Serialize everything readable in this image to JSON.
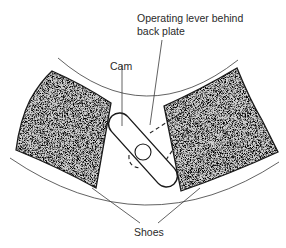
{
  "diagram": {
    "type": "brake-cam-mechanism",
    "labels": {
      "cam": "Cam",
      "lever_line1": "Operating lever behind",
      "lever_line2": "back plate",
      "shoes": "Shoes"
    },
    "colors": {
      "background": "#ffffff",
      "line": "#1a1a1a",
      "shoe_fill_dark": "#3a3a3a",
      "shoe_fill_light": "#cfcfcf",
      "text": "#2a2a2a"
    },
    "components": [
      {
        "id": "outer-drum-arc-upper",
        "kind": "arc"
      },
      {
        "id": "outer-drum-arc-lower",
        "kind": "arc"
      },
      {
        "id": "left-brake-shoe",
        "kind": "shoe"
      },
      {
        "id": "right-brake-shoe",
        "kind": "shoe"
      },
      {
        "id": "cam",
        "kind": "rounded-bar"
      },
      {
        "id": "cam-pivot",
        "kind": "circle"
      },
      {
        "id": "operating-lever",
        "kind": "dashed-outline"
      }
    ]
  }
}
